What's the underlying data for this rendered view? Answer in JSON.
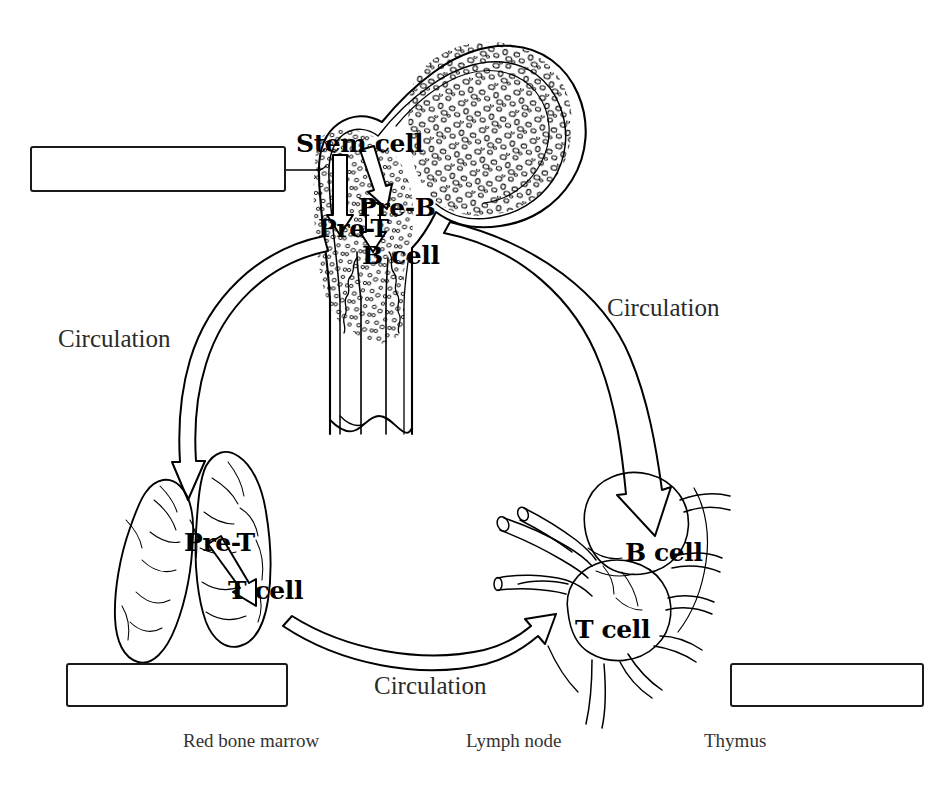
{
  "figure": {
    "background_color": "#ffffff",
    "line_color": "#000000"
  },
  "cell_labels": [
    {
      "text": "Stem cell",
      "x": 296,
      "y": 131
    },
    {
      "text": "Pre-B",
      "x": 358,
      "y": 195
    },
    {
      "text": "Pre-T",
      "x": 318,
      "y": 216
    },
    {
      "text": "B cell",
      "x": 362,
      "y": 243
    },
    {
      "text": "Pre-T",
      "x": 184,
      "y": 530
    },
    {
      "text": "T cell",
      "x": 228,
      "y": 578
    },
    {
      "text": "B cell",
      "x": 625,
      "y": 540
    },
    {
      "text": "T cell",
      "x": 575,
      "y": 617
    }
  ],
  "circulation_labels": [
    {
      "text": "Circulation",
      "x": 58,
      "y": 326
    },
    {
      "text": "Circulation",
      "x": 607,
      "y": 295
    },
    {
      "text": "Circulation",
      "x": 374,
      "y": 673
    }
  ],
  "captions": [
    {
      "text": "Red bone marrow",
      "x": 183,
      "y": 731
    },
    {
      "text": "Lymph node",
      "x": 466,
      "y": 731
    },
    {
      "text": "Thymus",
      "x": 704,
      "y": 731
    }
  ],
  "answer_boxes": [
    {
      "name": "answer-box-red-bone-marrow",
      "value": "",
      "x": 30,
      "y": 146,
      "w": 256,
      "h": 46
    },
    {
      "name": "answer-box-thymus",
      "value": "",
      "x": 66,
      "y": 663,
      "w": 222,
      "h": 44
    },
    {
      "name": "answer-box-lymph-node",
      "value": "",
      "x": 730,
      "y": 663,
      "w": 194,
      "h": 44
    }
  ],
  "organs": [
    {
      "name": "femur-red-bone-marrow",
      "caption": "Red bone marrow"
    },
    {
      "name": "thymus-lobes",
      "caption": "Thymus"
    },
    {
      "name": "lymph-node",
      "caption": "Lymph node"
    }
  ],
  "flow_arrows": [
    {
      "name": "stem-cell-to-pre-t",
      "from": "Stem cell",
      "to": "Pre-T"
    },
    {
      "name": "stem-cell-to-pre-b",
      "from": "Stem cell",
      "to": "Pre-B"
    },
    {
      "name": "pre-b-to-b-cell",
      "from": "Pre-B",
      "to": "B cell"
    },
    {
      "name": "marrow-to-thymus",
      "from": "Red bone marrow",
      "to": "Thymus",
      "label": "Circulation"
    },
    {
      "name": "marrow-to-lymphnode",
      "from": "Red bone marrow",
      "to": "Lymph node",
      "label": "Circulation"
    },
    {
      "name": "thymus-to-lymphnode",
      "from": "Thymus",
      "to": "Lymph node",
      "label": "Circulation"
    },
    {
      "name": "pre-t-to-t-cell",
      "from": "Pre-T",
      "to": "T cell"
    }
  ]
}
